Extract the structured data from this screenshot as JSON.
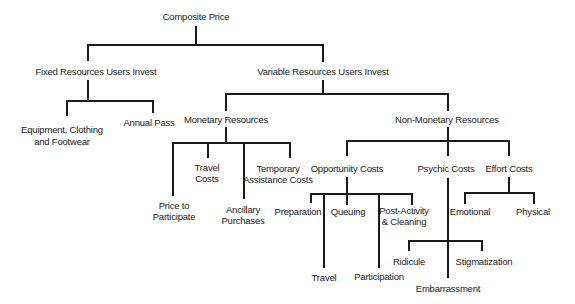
{
  "diagram": {
    "type": "hierarchy-tree",
    "root": "Composite Price",
    "nodes": {
      "composite_price": "Composite Price",
      "fixed": "Fixed Resources Users Invest",
      "variable": "Variable Resources Users Invest",
      "equipment_l1": "Equipment, Clothing",
      "equipment_l2": "and Footwear",
      "annual_pass": "Annual Pass",
      "monetary": "Monetary Resources",
      "non_monetary": "Non-Monetary Resources",
      "price_l1": "Price to",
      "price_l2": "Participate",
      "travel_costs_l1": "Travel",
      "travel_costs_l2": "Costs",
      "ancillary_l1": "Ancillary",
      "ancillary_l2": "Purchases",
      "temporary_l1": "Temporary",
      "temporary_l2": "Assistance Costs",
      "opportunity": "Opportunity Costs",
      "psychic": "Psychic Costs",
      "effort": "Effort Costs",
      "preparation": "Preparation",
      "travel": "Travel",
      "queuing": "Queuing",
      "participation": "Participation",
      "post_activity_l1": "Post-Activity",
      "post_activity_l2": "& Cleaning",
      "ridicule": "Ridicule",
      "embarrassment": "Embarrassment",
      "stigmatization": "Stigmatization",
      "emotional": "Emotional",
      "physical": "Physical"
    },
    "edges": [
      [
        "Composite Price",
        "Fixed Resources Users Invest"
      ],
      [
        "Composite Price",
        "Variable Resources Users Invest"
      ],
      [
        "Fixed Resources Users Invest",
        "Equipment, Clothing and Footwear"
      ],
      [
        "Fixed Resources Users Invest",
        "Annual Pass"
      ],
      [
        "Variable Resources Users Invest",
        "Monetary Resources"
      ],
      [
        "Variable Resources Users Invest",
        "Non-Monetary Resources"
      ],
      [
        "Monetary Resources",
        "Price to Participate"
      ],
      [
        "Monetary Resources",
        "Travel Costs"
      ],
      [
        "Monetary Resources",
        "Ancillary Purchases"
      ],
      [
        "Monetary Resources",
        "Temporary Assistance Costs"
      ],
      [
        "Non-Monetary Resources",
        "Opportunity Costs"
      ],
      [
        "Non-Monetary Resources",
        "Psychic Costs"
      ],
      [
        "Non-Monetary Resources",
        "Effort Costs"
      ],
      [
        "Opportunity Costs",
        "Preparation"
      ],
      [
        "Opportunity Costs",
        "Travel"
      ],
      [
        "Opportunity Costs",
        "Queuing"
      ],
      [
        "Opportunity Costs",
        "Participation"
      ],
      [
        "Opportunity Costs",
        "Post-Activity & Cleaning"
      ],
      [
        "Psychic Costs",
        "Ridicule"
      ],
      [
        "Psychic Costs",
        "Embarrassment"
      ],
      [
        "Psychic Costs",
        "Stigmatization"
      ],
      [
        "Effort Costs",
        "Emotional"
      ],
      [
        "Effort Costs",
        "Physical"
      ]
    ]
  }
}
